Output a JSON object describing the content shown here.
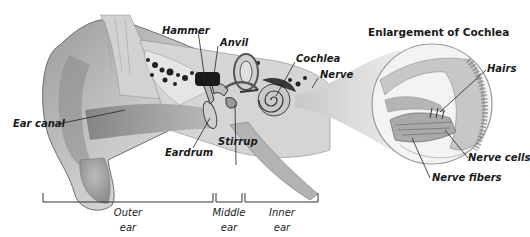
{
  "diagram": {
    "title": "Enlargement of Cochlea",
    "labels": {
      "hammer": "Hammer",
      "anvil": "Anvil",
      "cochlea": "Cochlea",
      "nerve": "Nerve",
      "ear_canal": "Ear canal",
      "eardrum": "Eardrum",
      "stirrup": "Stirrup",
      "hairs": "Hairs",
      "nerve_cells": "Nerve cells",
      "nerve_fibers": "Nerve fibers"
    },
    "regions": [
      {
        "line1": "Outer",
        "line2": "ear"
      },
      {
        "line1": "Middle",
        "line2": "ear"
      },
      {
        "line1": "Inner",
        "line2": "ear"
      }
    ]
  }
}
